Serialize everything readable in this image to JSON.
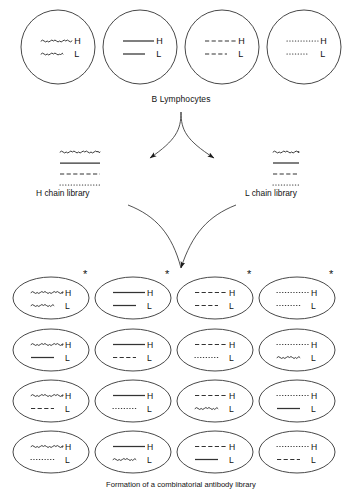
{
  "figure": {
    "title": "B Lymphocytes",
    "caption": "Formation of a combinatorial antibody library",
    "stroke_color": "#333333",
    "text_color": "#111111"
  },
  "labels": {
    "h_chain": "H",
    "l_chain": "L",
    "asterisk": "*",
    "h_library": "H chain library",
    "l_library": "L chain library",
    "b_lymphocytes": "B Lymphocytes"
  },
  "line_styles": [
    "wavy",
    "solid",
    "dashed",
    "dotted"
  ],
  "b_lymphocytes": [
    {
      "id": "bcell-1",
      "h": "wavy",
      "l": "wavy"
    },
    {
      "id": "bcell-2",
      "h": "solid",
      "l": "solid"
    },
    {
      "id": "bcell-3",
      "h": "dashed",
      "l": "dashed"
    },
    {
      "id": "bcell-4",
      "h": "dotted",
      "l": "dotted"
    }
  ],
  "h_chain_library": {
    "label": "H chain library",
    "chains": [
      "wavy",
      "solid",
      "dashed",
      "dotted"
    ]
  },
  "l_chain_library": {
    "label": "L chain library",
    "chains": [
      "wavy",
      "solid",
      "dashed",
      "dotted"
    ]
  },
  "combinatorial_library": {
    "rows": [
      [
        {
          "h": "wavy",
          "l": "wavy",
          "starred": true
        },
        {
          "h": "solid",
          "l": "solid",
          "starred": true
        },
        {
          "h": "dashed",
          "l": "dashed",
          "starred": true
        },
        {
          "h": "dotted",
          "l": "dotted",
          "starred": true
        }
      ],
      [
        {
          "h": "wavy",
          "l": "solid",
          "starred": false
        },
        {
          "h": "solid",
          "l": "dashed",
          "starred": false
        },
        {
          "h": "dashed",
          "l": "dotted",
          "starred": false
        },
        {
          "h": "dotted",
          "l": "wavy",
          "starred": false
        }
      ],
      [
        {
          "h": "wavy",
          "l": "dashed",
          "starred": false
        },
        {
          "h": "solid",
          "l": "dotted",
          "starred": false
        },
        {
          "h": "dashed",
          "l": "wavy",
          "starred": false
        },
        {
          "h": "dotted",
          "l": "solid",
          "starred": false
        }
      ],
      [
        {
          "h": "wavy",
          "l": "dotted",
          "starred": false
        },
        {
          "h": "solid",
          "l": "wavy",
          "starred": false
        },
        {
          "h": "dashed",
          "l": "solid",
          "starred": false
        },
        {
          "h": "dotted",
          "l": "dashed",
          "starred": false
        }
      ]
    ]
  }
}
